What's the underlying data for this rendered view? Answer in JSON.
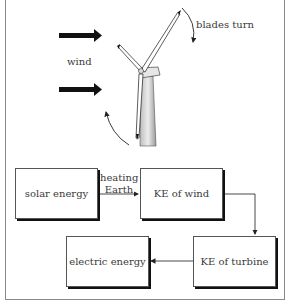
{
  "illustration": {
    "wind_label": "wind",
    "blades_label": "blades turn"
  },
  "flow": {
    "boxes": [
      {
        "id": "solar",
        "label": "solar energy"
      },
      {
        "id": "wind",
        "label": "KE of wind"
      },
      {
        "id": "turbine",
        "label": "KE of turbine"
      },
      {
        "id": "electric",
        "label": "electric energy"
      }
    ],
    "arrow_labels": {
      "solar_to_wind_line1": "heating",
      "solar_to_wind_line2": "Earth"
    }
  }
}
